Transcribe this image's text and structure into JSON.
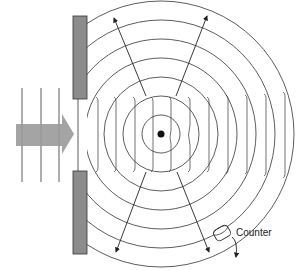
{
  "diagram": {
    "title": "",
    "labels": {
      "counter": "Counter"
    },
    "elements": {
      "incoming_beam": "wide gray arrow from left",
      "plane_waves": 3,
      "slit_barriers": 2,
      "scatterer": "central dot",
      "circular_wavefronts": 8,
      "scattered_arrows": 4
    },
    "colors": {
      "barrier": "#8c8c8c",
      "beam": "#9a9a9a",
      "line": "#333333"
    }
  }
}
